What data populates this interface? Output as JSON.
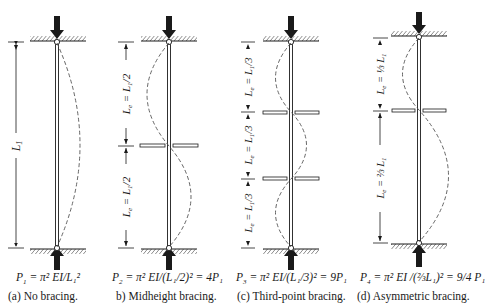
{
  "figure": {
    "panels": [
      {
        "id": "a",
        "caption": "(a)  No bracing.",
        "formula": {
          "lhs": "P",
          "lhs_sub": "1",
          "rhs": "= π² EI/L₁²"
        },
        "dimension_labels": [
          "L₁"
        ],
        "brace_positions": [],
        "effective_length": "L₁"
      },
      {
        "id": "b",
        "caption": "b)  Midheight bracing.",
        "formula": {
          "lhs": "P",
          "lhs_sub": "2",
          "rhs": "= π² EI/(L₁/2)² = 4P₁"
        },
        "dimension_labels": [
          "Lₑ = L₁/2",
          "Lₑ = L₁/2"
        ],
        "brace_positions": [
          "1/2"
        ],
        "effective_length": "L₁/2"
      },
      {
        "id": "c",
        "caption": "(c)  Third-point bracing.",
        "formula": {
          "lhs": "P",
          "lhs_sub": "3",
          "rhs": "= π² EI/(L₁/3)² = 9P₁"
        },
        "dimension_labels": [
          "Lₑ = L₁/3",
          "Lₑ = L₁/3",
          "Lₑ = L₁/3"
        ],
        "brace_positions": [
          "1/3",
          "2/3"
        ],
        "effective_length": "L₁/3"
      },
      {
        "id": "d",
        "caption": "(d)  Asymmetric bracing.",
        "formula": {
          "lhs": "P",
          "lhs_sub": "4",
          "rhs": "= π² EI /(⅔L₁)² = 9/4 P₁"
        },
        "dimension_labels": [
          "Lₑ = ⅓L₁",
          "Lₑ = ⅔L₁"
        ],
        "brace_positions": [
          "1/3"
        ],
        "effective_length": "2/3 L₁"
      }
    ],
    "icons": [
      "load-arrow-down-icon",
      "load-arrow-up-icon",
      "pin-support-icon",
      "hatched-ground-icon",
      "lateral-brace-icon",
      "buckled-shape-dashed-icon"
    ],
    "colors": {
      "ink": "#1a1a1a",
      "background": "#ffffff",
      "dashed_curve": "#555555"
    }
  }
}
